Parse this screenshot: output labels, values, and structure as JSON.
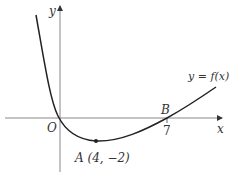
{
  "diagram": {
    "axes": {
      "x_label": "x",
      "y_label": "y",
      "origin_label": "O"
    },
    "curve": {
      "label": "y = f(x)",
      "color": "#222222"
    },
    "points": [
      {
        "name": "A",
        "label": "A (4, −2)",
        "x": 4,
        "y": -2,
        "kind": "minimum"
      },
      {
        "name": "B",
        "label": "B",
        "x": 7,
        "y": 0,
        "kind": "x-intercept"
      }
    ],
    "ticks": {
      "x7": "7"
    }
  }
}
